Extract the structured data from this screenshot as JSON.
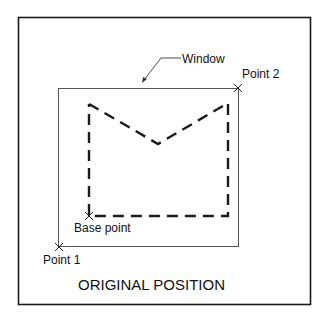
{
  "labels": {
    "window": "Window",
    "point2": "Point 2",
    "base_point": "Base point",
    "point1": "Point 1",
    "caption": "ORIGINAL POSITION"
  },
  "colors": {
    "stroke": "#1a1a1a",
    "window_stroke": "#555555",
    "background": "#ffffff"
  }
}
